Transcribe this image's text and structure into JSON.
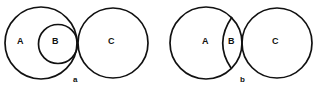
{
  "diagrams": [
    {
      "caption": "a",
      "description": "Set B contained within set A; A and C tangent",
      "labels": {
        "A": "A",
        "B": "B",
        "C": "C"
      }
    },
    {
      "caption": "b",
      "description": "Set B is a region inside A bordered by an arc; A and C tangent",
      "labels": {
        "A": "A",
        "B": "B",
        "C": "C"
      }
    }
  ],
  "colors": {
    "stroke": "#111111",
    "background": "#ffffff"
  }
}
